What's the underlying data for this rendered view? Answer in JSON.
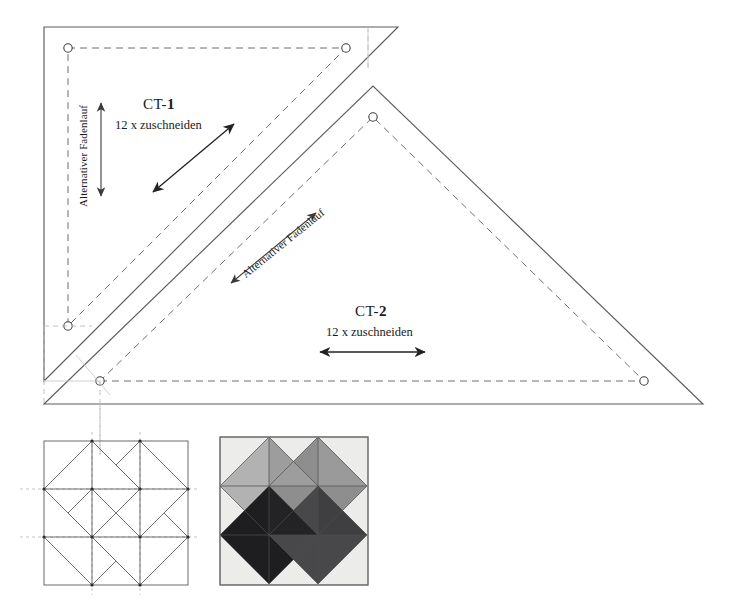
{
  "page": {
    "background": "#ffffff",
    "line_color": "#555555",
    "dash_color": "#777777",
    "arrow_color": "#222222"
  },
  "templates": [
    {
      "id": "ct-1",
      "name_prefix": "CT-",
      "name_number": "1",
      "full_label": "CT-1",
      "cut_instruction": "12 x zuschneiden",
      "grain_label": "Alternativer Fadenlauf",
      "grain_orientation": "vertical",
      "straight_grain_orientation": "diagonal-45",
      "shape": "right-triangle",
      "seam_allowance_shown": true
    },
    {
      "id": "ct-2",
      "name_prefix": "CT-",
      "name_number": "2",
      "full_label": "CT-2",
      "cut_instruction": "12 x zuschneiden",
      "grain_label": "Alternativer Fadenlauf",
      "grain_orientation": "diagonal-45",
      "straight_grain_orientation": "horizontal",
      "shape": "right-triangle",
      "seam_allowance_shown": true
    }
  ],
  "blocks": [
    {
      "id": "line-block",
      "type": "line-drawing",
      "grid": 3,
      "guides": "dashed-crosshairs",
      "fill": "#ffffff",
      "stroke": "#6b6b6b"
    },
    {
      "id": "color-block",
      "type": "colored",
      "grid": 3,
      "background": "#ececeb",
      "colors": {
        "light_gray": "#b0b0b0",
        "mid_gray": "#8d8d8d",
        "dark_gray": "#4b4b4d",
        "near_black": "#1d1d1f",
        "background": "#ececeb",
        "outline": "#5a5a5a"
      }
    }
  ]
}
